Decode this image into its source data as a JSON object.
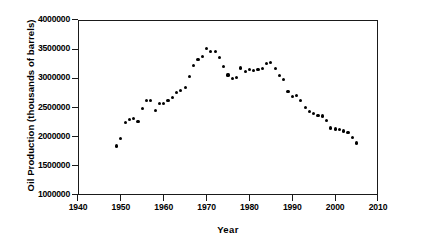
{
  "chart_data": {
    "type": "scatter",
    "title": "",
    "xlabel": "Year",
    "ylabel": "Oil Production (thousands of barrels)",
    "xlim": [
      1940,
      2010
    ],
    "ylim": [
      1000000,
      4000000
    ],
    "xticks": [
      1940,
      1950,
      1960,
      1970,
      1980,
      1990,
      2000,
      2010
    ],
    "xtick_labels": [
      "1940",
      "1950",
      "1960",
      "1970",
      "1980",
      "1990",
      "2000",
      "2010"
    ],
    "yticks": [
      1000000,
      1500000,
      2000000,
      2500000,
      3000000,
      3500000,
      4000000
    ],
    "ytick_labels": [
      "1000000",
      "1500000",
      "2000000",
      "2500000",
      "3000000",
      "3500000",
      "4000000"
    ],
    "grid": false,
    "legend": null,
    "marker": "filled-circle",
    "marker_color": "#000000",
    "series": [
      {
        "name": "Oil Production",
        "x": [
          1949,
          1950,
          1951,
          1952,
          1953,
          1954,
          1955,
          1956,
          1957,
          1958,
          1959,
          1960,
          1961,
          1962,
          1963,
          1964,
          1965,
          1966,
          1967,
          1968,
          1969,
          1970,
          1971,
          1972,
          1973,
          1974,
          1975,
          1976,
          1977,
          1978,
          1979,
          1980,
          1981,
          1982,
          1983,
          1984,
          1985,
          1986,
          1987,
          1988,
          1989,
          1990,
          1991,
          1992,
          1993,
          1994,
          1995,
          1996,
          1997,
          1998,
          1999,
          2000,
          2001,
          2002,
          2003,
          2004,
          2005
        ],
        "y": [
          1841000,
          1974000,
          2248000,
          2290000,
          2315000,
          2258000,
          2484000,
          2617000,
          2617000,
          2449000,
          2575000,
          2575000,
          2622000,
          2676000,
          2753000,
          2787000,
          2849000,
          3028000,
          3216000,
          3329000,
          3372000,
          3517000,
          3454000,
          3455000,
          3361000,
          3203000,
          3057000,
          3001000,
          3010000,
          3178000,
          3121000,
          3146000,
          3129000,
          3157000,
          3171000,
          3250000,
          3275000,
          3168000,
          3047000,
          2979000,
          2779000,
          2685000,
          2707000,
          2625000,
          2499000,
          2431000,
          2394000,
          2366000,
          2355000,
          2282000,
          2147000,
          2131000,
          2118000,
          2097000,
          2073000,
          1983000,
          1890000
        ]
      }
    ]
  }
}
